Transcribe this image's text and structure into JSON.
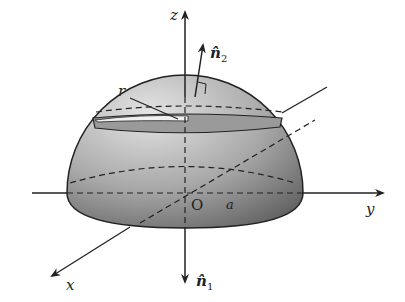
{
  "figure": {
    "labels": {
      "z_axis": "z",
      "y_axis": "y",
      "x_axis": "x",
      "origin": "O",
      "radius": "a",
      "slice_radius": "r",
      "normal_top": "n̂",
      "normal_top_sub": "2",
      "normal_bottom": "n̂",
      "normal_bottom_sub": "1"
    },
    "colors": {
      "surface_light": "#d9d9d9",
      "surface_dark": "#6e6e6e",
      "lines": "#222222"
    }
  }
}
